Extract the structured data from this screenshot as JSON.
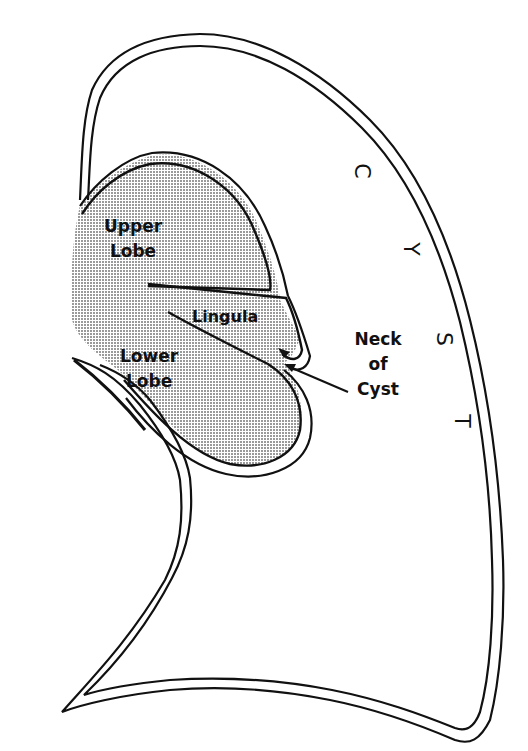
{
  "diagram": {
    "labels": {
      "upper_lobe": [
        "Upper",
        "Lobe"
      ],
      "lingula": "Lingula",
      "lower_lobe": [
        "Lower",
        "Lobe"
      ],
      "neck_of_cyst": [
        "Neck",
        "of",
        "Cyst"
      ],
      "cyst_letters": [
        "C",
        "Y",
        "S",
        "T"
      ]
    },
    "colors": {
      "outline": "#111111",
      "lung_fill": "#c8c8c8",
      "background": "#ffffff"
    }
  }
}
